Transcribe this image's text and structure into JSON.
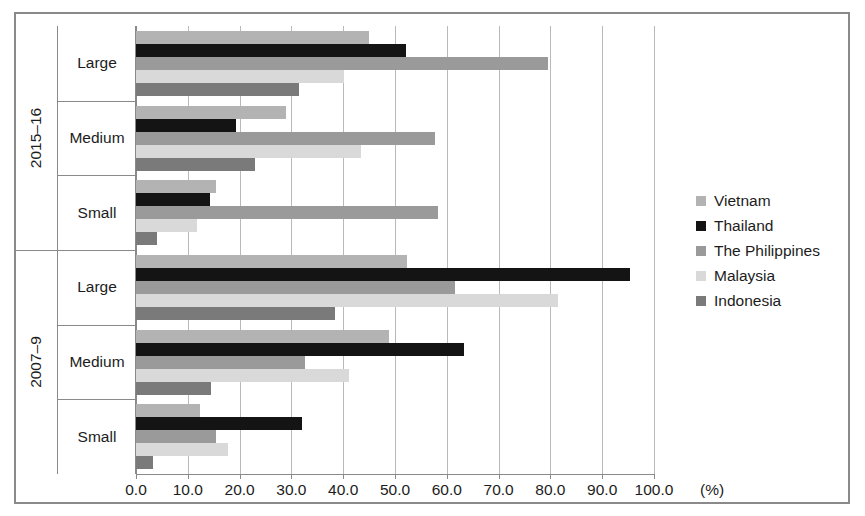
{
  "chart_data": {
    "type": "bar",
    "orientation": "horizontal",
    "title": "",
    "xlabel": "(%)",
    "ylabel": "",
    "xlim": [
      0,
      100
    ],
    "xticks": [
      "0.0",
      "10.0",
      "20.0",
      "30.0",
      "40.0",
      "50.0",
      "60.0",
      "70.0",
      "80.0",
      "90.0",
      "100.0"
    ],
    "xtick_values": [
      0,
      10,
      20,
      30,
      40,
      50,
      60,
      70,
      80,
      90,
      100
    ],
    "grid": true,
    "legend_position": "right",
    "groups": [
      "2015–16",
      "2007–9"
    ],
    "categories": [
      "Large",
      "Medium",
      "Small"
    ],
    "series": [
      {
        "name": "Vietnam",
        "color": "#b3b3b3",
        "values_2015_16": [
          44.9,
          28.9,
          15.5
        ],
        "values_2007_9": [
          52.4,
          48.8,
          12.4
        ]
      },
      {
        "name": "Thailand",
        "color": "#141414",
        "values_2015_16": [
          52.1,
          19.4,
          14.2
        ],
        "values_2007_9": [
          95.3,
          63.4,
          32.0
        ]
      },
      {
        "name": "The Philippines",
        "color": "#9a9a9a",
        "values_2015_16": [
          79.6,
          57.7,
          58.3
        ],
        "values_2007_9": [
          61.5,
          32.6,
          15.5
        ]
      },
      {
        "name": "Malaysia",
        "color": "#d9d9d9",
        "values_2015_16": [
          40.2,
          43.5,
          11.8
        ],
        "values_2007_9": [
          81.4,
          41.2,
          17.8
        ]
      },
      {
        "name": "Indonesia",
        "color": "#7a7a7a",
        "values_2015_16": [
          31.4,
          23.0,
          4.1
        ],
        "values_2007_9": [
          38.5,
          14.5,
          3.3
        ]
      }
    ]
  },
  "legend": {
    "items": [
      {
        "label": "Vietnam"
      },
      {
        "label": "Thailand"
      },
      {
        "label": "The Philippines"
      },
      {
        "label": "Malaysia"
      },
      {
        "label": "Indonesia"
      }
    ]
  },
  "axis": {
    "unit_label": "(%)"
  }
}
